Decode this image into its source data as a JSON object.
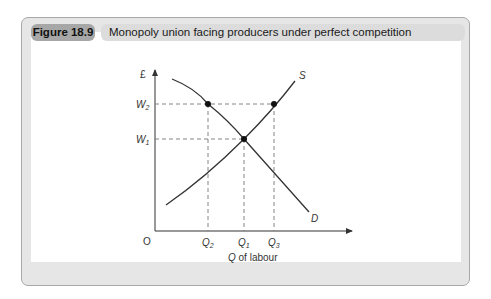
{
  "figure": {
    "number": "Figure 18.9",
    "title": "Monopoly union facing producers under perfect competition"
  },
  "diagram": {
    "y_axis_label": "£",
    "x_axis_label_italic": "Q",
    "x_axis_label_rest": " of labour",
    "origin_label": "O",
    "y_ticks": [
      {
        "main": "W",
        "sub": "2"
      },
      {
        "main": "W",
        "sub": "1"
      }
    ],
    "x_ticks": [
      {
        "main": "Q",
        "sub": "2"
      },
      {
        "main": "Q",
        "sub": "1"
      },
      {
        "main": "Q",
        "sub": "3"
      }
    ],
    "curves": {
      "supply_label": "S",
      "demand_label": "D"
    },
    "colors": {
      "curve": "#333333",
      "dashed": "#777777",
      "header_number_bg": "#a7a7a7",
      "header_title_bg": "#dcdcdc",
      "frame_bg": "#e6e6e6"
    }
  }
}
